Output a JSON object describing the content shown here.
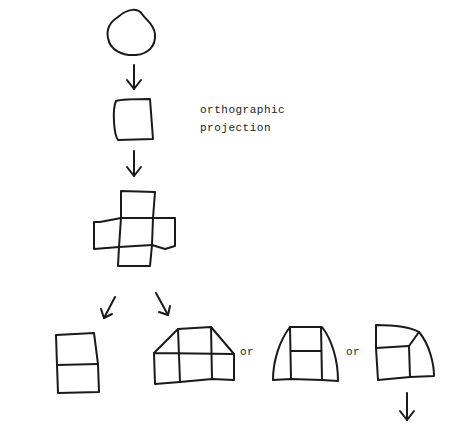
{
  "diagram": {
    "annotation": {
      "line1": "orthographic",
      "line2": "projection"
    },
    "connectors": {
      "or_1": "or",
      "or_2": "or"
    },
    "nodes": [
      {
        "id": "irregular-blob",
        "shape": "blob"
      },
      {
        "id": "square-projection",
        "shape": "square"
      },
      {
        "id": "cross-net",
        "shape": "cross of five squares"
      },
      {
        "id": "two-stacked-squares",
        "shape": "two stacked squares"
      },
      {
        "id": "trapezoid-grid",
        "shape": "three-square row with trapezoid top"
      },
      {
        "id": "arched-frame",
        "shape": "curved-sided frame with two inner squares"
      },
      {
        "id": "curved-corner-block",
        "shape": "block with curved corner"
      }
    ],
    "stroke_color": "#1a1a1a"
  }
}
